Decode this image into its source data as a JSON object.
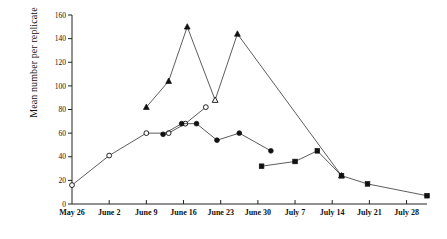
{
  "chart_data": {
    "type": "line",
    "title": "",
    "xlabel": "",
    "ylabel": "Mean number per replicate",
    "ylim": [
      0,
      160
    ],
    "ytick_step": 20,
    "yticks": [
      "0",
      "20",
      "40",
      "60",
      "80",
      "100",
      "120",
      "140",
      "160"
    ],
    "grid": false,
    "legend": "none",
    "categories": [
      "May 26",
      "June 2",
      "June 9",
      "June 16",
      "June 23",
      "June 30",
      "July 7",
      "July 14",
      "July 21",
      "July 28"
    ],
    "x_axis_weeks": [
      0,
      1,
      2,
      3,
      4,
      5,
      6,
      7,
      8,
      9
    ],
    "series": [
      {
        "name": "open-circle-series",
        "marker": "open-circle",
        "x": [
          0,
          1,
          2,
          2.6,
          3.05,
          3.6
        ],
        "values": [
          16,
          41,
          60,
          60,
          68,
          82
        ]
      },
      {
        "name": "filled-circle-series",
        "marker": "filled-circle",
        "x": [
          2.45,
          2.95,
          3.35,
          3.9,
          4.5,
          5.35
        ],
        "values": [
          59,
          68,
          68,
          54,
          60,
          45
        ]
      },
      {
        "name": "triangle-series",
        "marker": "triangle",
        "x": [
          2.0,
          2.6,
          3.1,
          3.85,
          4.45,
          7.25
        ],
        "values": [
          82,
          104,
          150,
          88,
          144,
          24
        ]
      },
      {
        "name": "filled-square-series",
        "marker": "filled-square",
        "x": [
          5.1,
          6.0,
          6.6,
          7.25,
          7.95,
          9.55
        ],
        "values": [
          32,
          36,
          45,
          24,
          17,
          7
        ]
      }
    ],
    "colors": {
      "axis": "#222222",
      "line": "#333333",
      "marker_fill": "#111111",
      "marker_open_fill": "#ffffff",
      "background": "#ffffff"
    }
  }
}
